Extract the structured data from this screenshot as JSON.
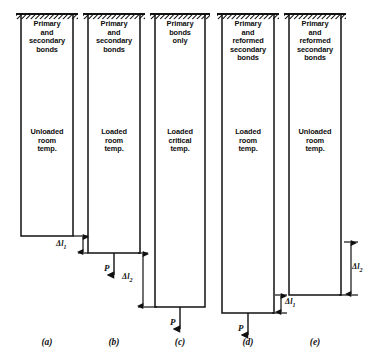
{
  "figure": {
    "ink_color": "#111111",
    "background_color": "#ffffff",
    "bars": [
      {
        "id": "a",
        "caption": "(a)",
        "top_text": "Primary\nand\nsecondary\nbonds",
        "state_text": "Unloaded\nroom\ntemp.",
        "x": 21,
        "width": 52,
        "top": 14,
        "bottom": 236,
        "has_support": true,
        "load_label": null,
        "dimension": {
          "label": "Δl",
          "sub": "1",
          "from_y": 236,
          "to_y": 253,
          "line_x": 83,
          "label_x": 56,
          "label_y": 239
        }
      },
      {
        "id": "b",
        "caption": "(b)",
        "top_text": "Primary\nand\nsecondary\nbonds",
        "state_text": "Loaded\nroom\ntemp.",
        "x": 88,
        "width": 52,
        "top": 14,
        "bottom": 253,
        "has_support": true,
        "load_label": "P",
        "dimension": {
          "label": "Δl",
          "sub": "2",
          "from_y": 253,
          "to_y": 307,
          "line_x": 143,
          "label_x": 122,
          "label_y": 272
        }
      },
      {
        "id": "c",
        "caption": "(c)",
        "top_text": "Primary\nbonds\nonly",
        "state_text": "Loaded\ncritical\ntemp.",
        "x": 155,
        "width": 50,
        "top": 14,
        "bottom": 307,
        "has_support": true,
        "load_label": "P",
        "dimension": null
      },
      {
        "id": "d",
        "caption": "(d)",
        "top_text": "Primary\nand\nreformed\nsecondary\nbonds",
        "state_text": "Loaded\nroom\ntemp.",
        "x": 222,
        "width": 52,
        "top": 14,
        "bottom": 313,
        "has_support": true,
        "load_label": "P",
        "dimension": {
          "label": "Δl",
          "sub": "1",
          "from_y": 295,
          "to_y": 313,
          "line_x": 281,
          "label_x": 285,
          "label_y": 297
        }
      },
      {
        "id": "e",
        "caption": "(e)",
        "top_text": "Primary\nand\nreformed\nsecondary\nbonds",
        "state_text": "Unloaded\nroom\ntemp.",
        "x": 289,
        "width": 52,
        "top": 14,
        "bottom": 295,
        "has_support": true,
        "load_label": null,
        "dimension": {
          "label": "Δl",
          "sub": "2",
          "from_y": 242,
          "to_y": 295,
          "line_x": 351,
          "label_x": 352,
          "label_y": 262
        }
      }
    ],
    "caption_y": 337,
    "top_text_y": 20,
    "state_text_y": 128
  }
}
